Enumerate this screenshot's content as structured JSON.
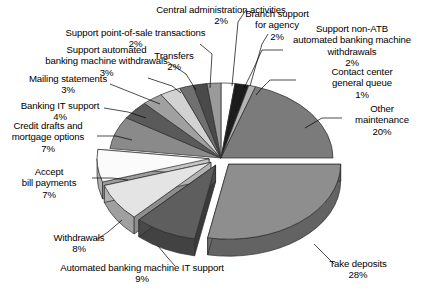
{
  "chart_data": {
    "type": "pie",
    "title": "",
    "subtitle": "",
    "xlabel": "",
    "ylabel": "",
    "legend_position": "none",
    "grid": false,
    "style": "3d-exploded-pie",
    "value_unit": "%",
    "total": 100,
    "categories": [
      "Branch support for agency",
      "Support non-ATB automated banking machine withdrawals",
      "Contact center general queue",
      "Other maintenance",
      "Take deposits",
      "Automated banking machine IT support",
      "Withdrawals",
      "Accept bill payments",
      "Credit drafts and mortgage options",
      "Banking IT support",
      "Mailing statements",
      "Support automated banking machine withdrawals",
      "Support point-of-sale transactions",
      "Transfers",
      "Central administration activities"
    ],
    "values": [
      2,
      2,
      1,
      20,
      28,
      9,
      8,
      7,
      7,
      4,
      3,
      3,
      2,
      2,
      2
    ],
    "slices": [
      {
        "label": "Branch support for agency",
        "value": 2,
        "value_text": "2%",
        "color": "#ffffff",
        "exploded": false
      },
      {
        "label": "Support non-ATB automated banking machine withdrawals",
        "value": 2,
        "value_text": "2%",
        "color": "#1c1c1c",
        "exploded": false
      },
      {
        "label": "Contact center general queue",
        "value": 1,
        "value_text": "1%",
        "color": "#b4b4b4",
        "exploded": false
      },
      {
        "label": "Other maintenance",
        "value": 20,
        "value_text": "20%",
        "color": "#7b7b7b",
        "exploded": false
      },
      {
        "label": "Take deposits",
        "value": 28,
        "value_text": "28%",
        "color": "#8e8e8e",
        "exploded": true
      },
      {
        "label": "Automated banking machine IT support",
        "value": 9,
        "value_text": "9%",
        "color": "#5e5e5e",
        "exploded": true
      },
      {
        "label": "Withdrawals",
        "value": 8,
        "value_text": "8%",
        "color": "#e4e4e4",
        "exploded": true
      },
      {
        "label": "Accept bill payments",
        "value": 7,
        "value_text": "7%",
        "color": "#fbfbfb",
        "exploded": true
      },
      {
        "label": "Credit drafts and mortgage options",
        "value": 7,
        "value_text": "7%",
        "color": "#8a8a8a",
        "exploded": false
      },
      {
        "label": "Banking IT support",
        "value": 4,
        "value_text": "4%",
        "color": "#5a5a5a",
        "exploded": false
      },
      {
        "label": "Mailing statements",
        "value": 3,
        "value_text": "3%",
        "color": "#a0a0a0",
        "exploded": false
      },
      {
        "label": "Support automated banking machine withdrawals",
        "value": 3,
        "value_text": "3%",
        "color": "#d2d2d2",
        "exploded": false
      },
      {
        "label": "Support point-of-sale transactions",
        "value": 2,
        "value_text": "2%",
        "color": "#707070",
        "exploded": false
      },
      {
        "label": "Transfers",
        "value": 2,
        "value_text": "2%",
        "color": "#4a4a4a",
        "exploded": false
      },
      {
        "label": "Central administration activities",
        "value": 2,
        "value_text": "2%",
        "color": "#9a9a9a",
        "exploded": false
      }
    ]
  },
  "labels": {
    "central_administration": "Central administration activities\n2%",
    "point_of_sale": "Support point-of-sale transactions\n2%",
    "support_automated_abm": "Support automated\nbanking machine withdrawals\n3%",
    "mailing_statements": "Mailing statements\n3%",
    "banking_it_support": "Banking IT support\n4%",
    "credit_drafts": "Credit drafts and\nmortgage options\n7%",
    "accept_bill_payments": "Accept\nbill payments\n7%",
    "withdrawals": "Withdrawals\n8%",
    "abm_it_support": "Automated banking machine IT support\n9%",
    "transfers": "Transfers\n2%",
    "branch_support": "Branch support\nfor agency\n2%",
    "support_non_atb": "Support non-ATB\nautomated banking machine\nwithdrawals\n2%",
    "contact_center": "Contact center\ngeneral queue\n1%",
    "other_maintenance": "Other\nmaintenance\n20%",
    "take_deposits": "Take deposits\n28%"
  }
}
